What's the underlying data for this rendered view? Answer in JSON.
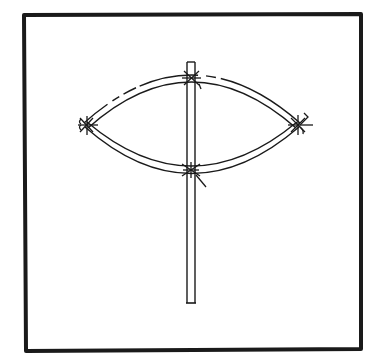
{
  "diagram": {
    "title": "",
    "colors": {
      "ink": "#1a1a1a",
      "background": "#ffffff"
    },
    "border": {
      "x1": 24,
      "y1": 14,
      "x2": 361,
      "y2": 350,
      "stroke_width": 4
    },
    "vertical_stick": {
      "x_left": 187,
      "x_right": 195,
      "y_top": 62,
      "y_bottom": 303
    },
    "upper_arc": {
      "left": [
        86,
        125
      ],
      "control": [
        191,
        30
      ],
      "right": [
        298,
        125
      ]
    },
    "lower_arc": {
      "left": [
        86,
        125
      ],
      "control": [
        191,
        215
      ],
      "right": [
        298,
        125
      ]
    },
    "ties": [
      {
        "name": "top-tie",
        "x": 191,
        "y": 78
      },
      {
        "name": "left-tie",
        "x": 86,
        "y": 125
      },
      {
        "name": "right-tie",
        "x": 298,
        "y": 125
      },
      {
        "name": "bottom-tie",
        "x": 191,
        "y": 170
      }
    ]
  }
}
